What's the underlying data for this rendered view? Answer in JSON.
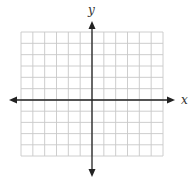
{
  "diagram": {
    "type": "coordinate-grid",
    "x_axis_label": "x",
    "y_axis_label": "y",
    "grid": {
      "columns": 12,
      "rows": 11,
      "columns_left_of_y_axis": 6,
      "columns_right_of_y_axis": 6,
      "rows_above_x_axis": 6,
      "rows_below_x_axis": 5,
      "grid_color": "#c8c8c8",
      "axis_color": "#222222"
    },
    "axes": {
      "x_axis_arrows": [
        "left",
        "right"
      ],
      "y_axis_arrows": [
        "up",
        "down"
      ]
    }
  }
}
